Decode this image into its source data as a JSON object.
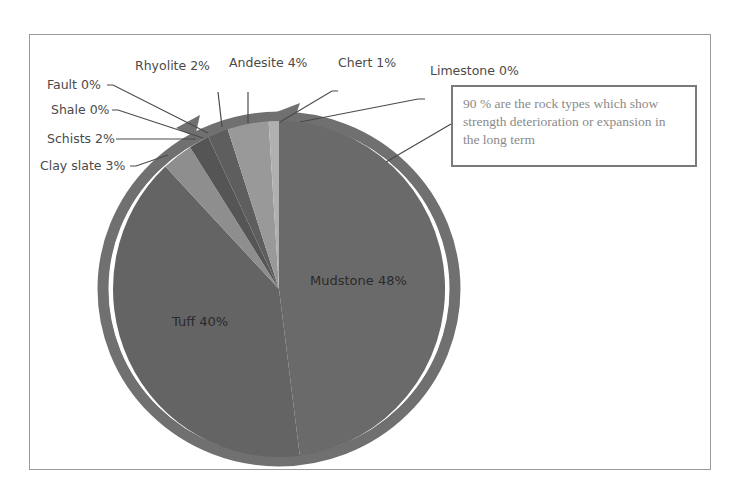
{
  "chart_data": {
    "type": "pie",
    "title": "",
    "categories": [
      "Mudstone",
      "Tuff",
      "Clay slate",
      "Schists",
      "Shale",
      "Fault",
      "Rhyolite",
      "Andesite",
      "Chert",
      "Limestone"
    ],
    "values": [
      48,
      40,
      3,
      2,
      0,
      0,
      2,
      4,
      1,
      0
    ],
    "labels": [
      "Mudstone 48%",
      "Tuff 40%",
      "Clay slate 3%",
      "Schists 2%",
      "Shale 0%",
      "Fault 0%",
      "Rhyolite 2%",
      "Andesite 4%",
      "Chert 1%",
      "Limestone 0%"
    ],
    "colors": [
      "#6a6a6a",
      "#646464",
      "#8e8e8e",
      "#555555",
      "#707070",
      "#7a7a7a",
      "#5e5e5e",
      "#999999",
      "#b0b0b0",
      "#bdbdbd"
    ],
    "annotation": "90 % are the rock types which show strength deterioration or expansion in the long term",
    "annotation_arc": "Arc arrow spanning Mudstone + Tuff (90%)",
    "legend": "none (data labels with leader lines)"
  },
  "labels": {
    "mudstone": "Mudstone 48%",
    "tuff": "Tuff 40%",
    "clay_slate": "Clay slate 3%",
    "schists": "Schists 2%",
    "shale": "Shale 0%",
    "fault": "Fault 0%",
    "rhyolite": "Rhyolite 2%",
    "andesite": "Andesite 4%",
    "chert": "Chert 1%",
    "limestone": "Limestone 0%"
  },
  "note": {
    "text": "90 % are the rock types which show strength deterioration or expansion in the long term"
  },
  "colors": {
    "frame": "#9a9a9a",
    "ring": "#707070",
    "note_border": "#7a7a7a",
    "note_text": "#8a8a8a"
  }
}
